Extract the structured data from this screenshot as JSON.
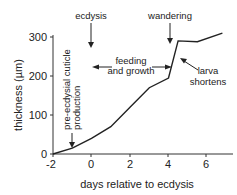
{
  "chart_data": {
    "type": "line",
    "title": "",
    "xlabel": "days relative to ecdysis",
    "ylabel": "thickness (µm)",
    "xlim": [
      -2,
      7
    ],
    "ylim": [
      0,
      320
    ],
    "xticks": [
      "-2",
      "0",
      "2",
      "4",
      "6"
    ],
    "yticks": [
      "0",
      "100",
      "200",
      "300"
    ],
    "grid": false,
    "legend": null,
    "series": [
      {
        "name": "cuticle thickness",
        "x": [
          -2,
          -1,
          0,
          1,
          2,
          3,
          4,
          4.5,
          5.5,
          6.8
        ],
        "y": [
          0,
          15,
          40,
          70,
          120,
          170,
          195,
          290,
          288,
          310
        ]
      }
    ],
    "annotations": [
      {
        "text": "ecdysis",
        "type": "arrow-down",
        "x": 0
      },
      {
        "text": "wandering",
        "type": "arrow-down",
        "x": 4.2
      },
      {
        "text": "feeding and growth",
        "type": "double-arrow",
        "x_range": [
          0,
          4.2
        ]
      },
      {
        "text": "larva shortens",
        "type": "arrow-pointer",
        "x": 4.5
      },
      {
        "text": "pre-ecdysial cuticle production",
        "type": "arrow-down-vertical-text",
        "x": -1
      }
    ]
  }
}
